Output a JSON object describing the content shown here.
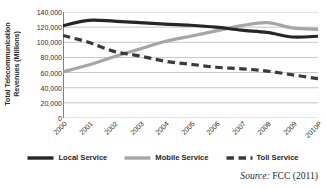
{
  "chart_data": {
    "type": "line",
    "title": "",
    "xlabel": "",
    "ylabel": "Total Telecommunication Revenues (Millions)",
    "categories": [
      "2000",
      "2001",
      "2002",
      "2003",
      "2004",
      "2005",
      "2006",
      "2007",
      "2008",
      "2009",
      "2010P"
    ],
    "ylim": [
      0,
      140000
    ],
    "ytick_step": 20000,
    "ytick_labels": [
      "140,000",
      "120,000",
      "100,000",
      "80,000",
      "60,000",
      "40,000",
      "20,000",
      "0"
    ],
    "ytick_values": [
      140000,
      120000,
      100000,
      80000,
      60000,
      40000,
      20000,
      0
    ],
    "grid": "horizontal",
    "legend_position": "bottom",
    "series": [
      {
        "name": "Local Service",
        "style": "solid",
        "color": "#262626",
        "width": 3.2,
        "values": [
          122000,
          129000,
          128000,
          126000,
          124000,
          122500,
          120000,
          116000,
          113000,
          107000,
          108000
        ]
      },
      {
        "name": "Mobile Service",
        "style": "solid",
        "color": "#a6a6a6",
        "width": 3.2,
        "values": [
          61000,
          70000,
          81000,
          91000,
          101000,
          108000,
          115000,
          122000,
          126000,
          119000,
          117000
        ]
      },
      {
        "name": "Toll Service",
        "style": "dashed",
        "color": "#3a3a3a",
        "width": 3.2,
        "values": [
          109000,
          100000,
          88000,
          82000,
          75000,
          71000,
          67000,
          65000,
          62000,
          57000,
          52000
        ]
      }
    ],
    "annotations": [
      {
        "name": "source-note",
        "text": "Source: FCC (2011)"
      }
    ]
  },
  "axis": {
    "y_title_line1": "Total Telecommunication",
    "y_title_line2": "Revenues (Millions)"
  },
  "legend": {
    "items": [
      {
        "label": "Local Service"
      },
      {
        "label": "Mobile Service"
      },
      {
        "label": "Toll Service"
      }
    ]
  },
  "source": {
    "prefix": "Source:",
    "text": "FCC (2011)"
  },
  "colors": {
    "local": "#262626",
    "mobile": "#a6a6a6",
    "toll": "#3a3a3a",
    "grid": "#bfbfbf",
    "axis": "#808080",
    "text": "#2b2b2b",
    "background": "#ffffff"
  }
}
